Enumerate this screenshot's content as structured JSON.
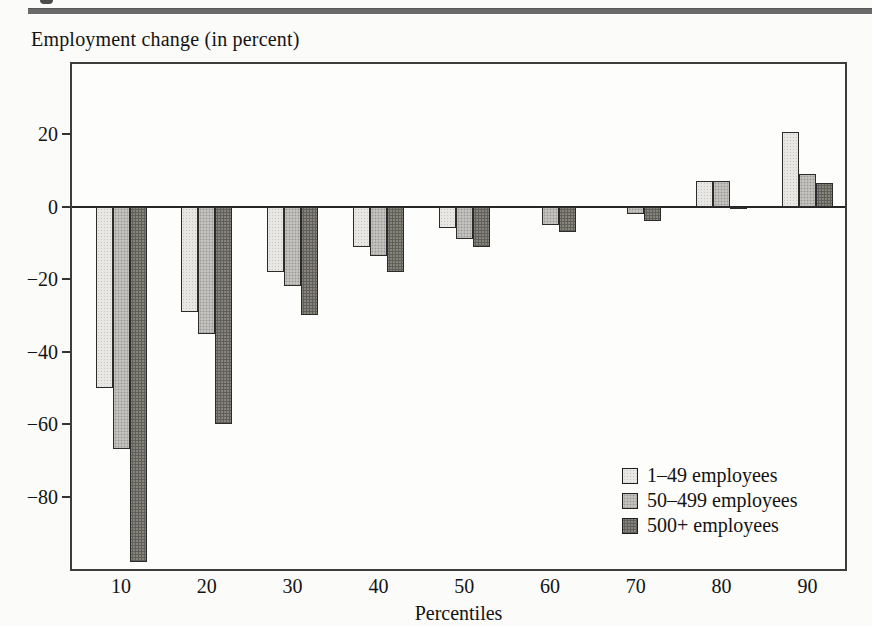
{
  "header": {
    "has_top_rule": true
  },
  "chart_data": {
    "type": "bar",
    "title": "Employment change (in percent)",
    "xlabel": "Percentiles",
    "ylabel": "Employment change (in percent)",
    "categories": [
      "10",
      "20",
      "30",
      "40",
      "50",
      "60",
      "70",
      "80",
      "90"
    ],
    "series": [
      {
        "name": "1–49 employees",
        "color": "#e9e7e3",
        "values": [
          -50,
          -29,
          -18,
          -11,
          -6,
          0,
          0,
          7,
          20.5
        ]
      },
      {
        "name": "50–499 employees",
        "color": "#c4c2be",
        "values": [
          -67,
          -35,
          -22,
          -13.5,
          -9,
          -5,
          -2,
          7,
          9
        ]
      },
      {
        "name": "500+ employees",
        "color": "#87847c",
        "values": [
          -98,
          -60,
          -30,
          -18,
          -11,
          -7,
          -4,
          -0.5,
          6.5
        ]
      }
    ],
    "yticks": [
      {
        "value": 20,
        "label": "20"
      },
      {
        "value": 0,
        "label": "0"
      },
      {
        "value": -20,
        "label": "−20"
      },
      {
        "value": -40,
        "label": "−40"
      },
      {
        "value": -60,
        "label": "−60"
      },
      {
        "value": -80,
        "label": "−80"
      }
    ],
    "ylim": [
      -100,
      39.4
    ],
    "grid": false,
    "legend_position": "inside-bottom-right"
  }
}
